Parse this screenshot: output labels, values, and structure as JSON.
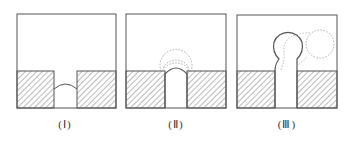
{
  "panels": [
    {
      "id": "I",
      "label": "(Ⅰ)",
      "stage": "meniscus at channel mouth"
    },
    {
      "id": "II",
      "label": "(Ⅱ)",
      "stage": "bubble emerging with expanding dotted outlines"
    },
    {
      "id": "III",
      "label": "(Ⅲ)",
      "stage": "bubble necking and detaching (dotted = detached position)"
    }
  ],
  "colors": {
    "stroke": "#555555",
    "hatch": "#777777",
    "dotted": "#999999",
    "background": "#ffffff"
  }
}
